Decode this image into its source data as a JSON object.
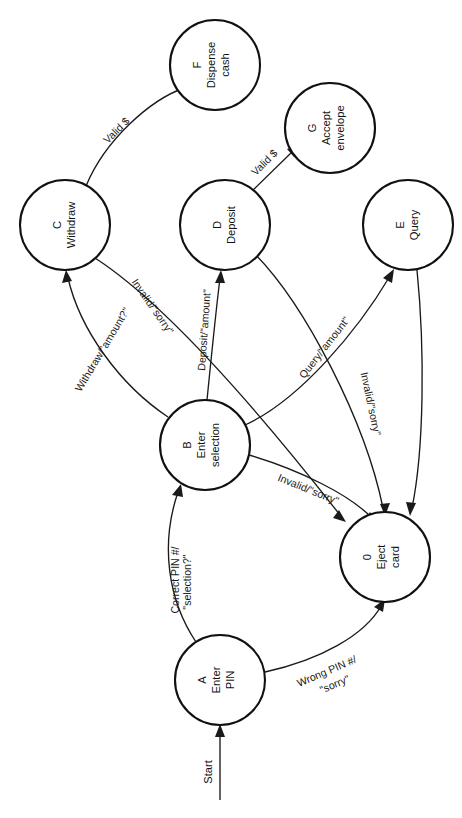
{
  "diagram": {
    "orientation": "rotated-90-clockwise",
    "stroke_color": "#1a1a1a",
    "node_fill": "#ffffff",
    "background": "#ffffff",
    "start_label": "Start",
    "nodes": [
      {
        "id": "0",
        "line1": "Eject",
        "line2": "card",
        "cx": 385,
        "cy": 557,
        "r": 45
      },
      {
        "id": "A",
        "line1": "Enter",
        "line2": "PIN",
        "cx": 220,
        "cy": 680,
        "r": 45
      },
      {
        "id": "B",
        "line1": "Enter",
        "line2": "selection",
        "cx": 205,
        "cy": 445,
        "r": 45
      },
      {
        "id": "C",
        "line1": "Withdraw",
        "line2": "",
        "cx": 65,
        "cy": 225,
        "r": 45
      },
      {
        "id": "D",
        "line1": "Deposit",
        "line2": "",
        "cx": 225,
        "cy": 225,
        "r": 45
      },
      {
        "id": "E",
        "line1": "Query",
        "line2": "",
        "cx": 408,
        "cy": 225,
        "r": 45
      },
      {
        "id": "F",
        "line1": "Dispense",
        "line2": "cash",
        "cx": 215,
        "cy": 65,
        "r": 45
      },
      {
        "id": "G",
        "line1": "Accept",
        "line2": "envelope",
        "cx": 330,
        "cy": 128,
        "r": 45
      }
    ],
    "edges": [
      {
        "from": "start",
        "to": "A",
        "label": "Start"
      },
      {
        "from": "A",
        "to": "B",
        "label1": "Correct PIN #/",
        "label2": "\"selection?\""
      },
      {
        "from": "A",
        "to": "0",
        "label1": "Wrong PIN #/",
        "label2": "\"sorry\""
      },
      {
        "from": "B",
        "to": "C",
        "label": "Withdraw/\"amount?\""
      },
      {
        "from": "B",
        "to": "D",
        "label": "Deposit/\"amount\""
      },
      {
        "from": "B",
        "to": "E",
        "label": "Query/\"amount\""
      },
      {
        "from": "B",
        "to": "0",
        "label": "Invalid/\"sorry\""
      },
      {
        "from": "C",
        "to": "F",
        "label": "Valid $"
      },
      {
        "from": "C",
        "to": "0",
        "label": "Invalid/\"sorry\""
      },
      {
        "from": "D",
        "to": "G",
        "label": "Valid $"
      },
      {
        "from": "D",
        "to": "0",
        "label": "Invalid/\"sorry\""
      },
      {
        "from": "E",
        "to": "0",
        "label": ""
      }
    ]
  }
}
